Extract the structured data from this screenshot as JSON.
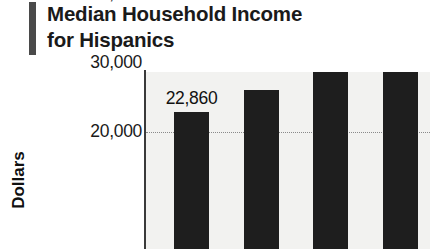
{
  "title": {
    "line1": "Median Household Income",
    "line2": "for Hispanics"
  },
  "accent_color": "#4a4a4a",
  "bar_color": "#1e1e1e",
  "plot_background": "#f2f2f0",
  "chart_data": {
    "type": "bar",
    "title": "Median Household Income for Hispanics",
    "xlabel": "",
    "ylabel": "Dollars",
    "ylim": [
      0,
      40000
    ],
    "yticks": [
      20000,
      30000,
      40000
    ],
    "ytick_labels": [
      "20,000",
      "30,000",
      "40,000"
    ],
    "grid": true,
    "legend": false,
    "categories": [
      "",
      "",
      "",
      ""
    ],
    "values": [
      22860,
      26100,
      30150,
      33565
    ],
    "data_labels": [
      "22,860",
      "",
      "",
      "33,565"
    ],
    "note": "bottom of chart is cropped; x-axis category labels not visible"
  }
}
